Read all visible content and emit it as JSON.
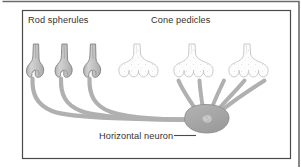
{
  "figure": {
    "kind": "anatomical-diagram",
    "labels": {
      "rod_spherules": "Rod spherules",
      "cone_pedicles": "Cone pedicles",
      "horizontal_neuron": "Horizontal neuron"
    },
    "structures": {
      "rod_spherules": {
        "name": "Rod spherules",
        "count": 3,
        "description": "Narrow stalk widening to a rounded bulb with a basal invagination",
        "shading": "gray-filled"
      },
      "cone_pedicles": {
        "name": "Cone pedicles",
        "count": 3,
        "description": "Broad trumpet-shaped terminal with a scalloped base of four lobes and stippled interior",
        "shading": "white with stipple"
      },
      "horizontal_neuron": {
        "name": "Horizontal neuron",
        "count": 1,
        "description": "Gray oval soma with nucleus, receiving three long rod axon processes from the left and five short dendrites fanning up to the cone pedicle lobes"
      },
      "rod_processes": 3,
      "cone_dendrites": 5
    },
    "colors": {
      "background": "#ffffff",
      "outer_frame": "#6b6b6b",
      "inner_frame": "#4a4a4a",
      "neuron_fill": "#a6a6a6",
      "neuron_stroke": "#8c8c8c",
      "nucleus_fill": "#c9c9c9",
      "rod_fill": "#c4c4c4",
      "rod_stroke": "#7c7c7c",
      "cone_fill": "#fdfdfd",
      "cone_stroke": "#c3c3c3",
      "text": "#33322f",
      "leader_line": "#4a4a4a"
    }
  }
}
